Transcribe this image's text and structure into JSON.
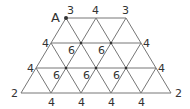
{
  "diagram": {
    "type": "triangular-grid",
    "point_label": "A",
    "line_color": "#777777",
    "text_color": "#333333",
    "rows": [
      {
        "y": 18,
        "xs": [
          66,
          96,
          126
        ],
        "labels": [
          "3",
          "4",
          "3"
        ]
      },
      {
        "y": 43,
        "xs": [
          51,
          81,
          111,
          141
        ],
        "labels": [
          "4",
          "6",
          "6",
          "4"
        ]
      },
      {
        "y": 68,
        "xs": [
          36,
          66,
          96,
          126,
          156
        ],
        "labels": [
          "4",
          "6",
          "6",
          "6",
          "4"
        ]
      },
      {
        "y": 93,
        "xs": [
          21,
          51,
          81,
          111,
          141,
          171
        ],
        "labels": [
          "2",
          "4",
          "4",
          "4",
          "4",
          "2"
        ]
      }
    ]
  },
  "labels": {
    "A": "A",
    "r1": [
      "3",
      "4",
      "3"
    ],
    "r2": [
      "4",
      "6",
      "6",
      "4"
    ],
    "r3": [
      "4",
      "6",
      "6",
      "6",
      "4"
    ],
    "r4": [
      "2",
      "4",
      "4",
      "4",
      "4",
      "2"
    ]
  }
}
